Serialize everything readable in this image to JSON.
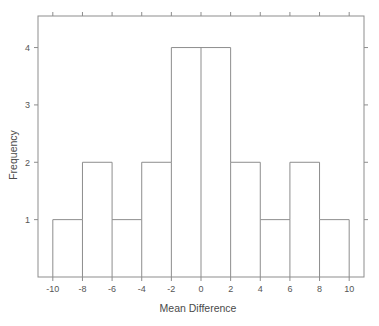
{
  "chart_data": {
    "type": "bar",
    "title": "",
    "subtitle": "",
    "xlabel": "Mean Difference",
    "ylabel": "Frequency",
    "bin_width": 2,
    "bin_edges": [
      -10,
      -8,
      -6,
      -4,
      -2,
      0,
      2,
      4,
      6,
      8,
      10
    ],
    "categories": [
      "-10 to -8",
      "-8 to -6",
      "-6 to -4",
      "-4 to -2",
      "-2 to 0",
      "0 to 2",
      "2 to 4",
      "4 to 6",
      "6 to 8",
      "8 to 10"
    ],
    "values": [
      1,
      2,
      1,
      2,
      4,
      4,
      2,
      1,
      2,
      1
    ],
    "total_count": 20,
    "xlim": [
      -11,
      11
    ],
    "ylim": [
      0,
      4.55
    ],
    "xticks": [
      -10,
      -8,
      -6,
      -4,
      -2,
      0,
      2,
      4,
      6,
      8,
      10
    ],
    "xticklabels": [
      "-10",
      "-8",
      "-6",
      "-4",
      "-2",
      "0",
      "2",
      "4",
      "6",
      "8",
      "10"
    ],
    "yticks": [
      1,
      2,
      3,
      4
    ],
    "yticklabels": [
      "1",
      "2",
      "3",
      "4"
    ],
    "grid": false,
    "legend": null,
    "legend_position": "none",
    "colors": {
      "line": "#8d8d8d",
      "fill": "#ffffff",
      "background": "#ffffff",
      "text": "#4a4a4a"
    }
  },
  "axes": {
    "x_axis_title": "Mean Difference",
    "y_axis_title": "Frequency"
  },
  "ticks": {
    "x": [
      {
        "value": -10,
        "label": "-10"
      },
      {
        "value": -8,
        "label": "-8"
      },
      {
        "value": -6,
        "label": "-6"
      },
      {
        "value": -4,
        "label": "-4"
      },
      {
        "value": -2,
        "label": "-2"
      },
      {
        "value": 0,
        "label": "0"
      },
      {
        "value": 2,
        "label": "2"
      },
      {
        "value": 4,
        "label": "4"
      },
      {
        "value": 6,
        "label": "6"
      },
      {
        "value": 8,
        "label": "8"
      },
      {
        "value": 10,
        "label": "10"
      }
    ],
    "y": [
      {
        "value": 1,
        "label": "1"
      },
      {
        "value": 2,
        "label": "2"
      },
      {
        "value": 3,
        "label": "3"
      },
      {
        "value": 4,
        "label": "4"
      }
    ]
  }
}
